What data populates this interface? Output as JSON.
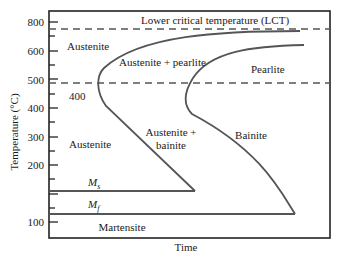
{
  "diagram": {
    "type": "TTT diagram (time-temperature-transformation)",
    "x_axis_label": "Time",
    "y_axis_label": "Temperature (°C)",
    "y_ticks": [
      "800",
      "600",
      "500",
      "400",
      "300",
      "200",
      "100"
    ],
    "lines": {
      "lct_label": "Lower critical temperature (LCT)",
      "ms_label": "M",
      "ms_sub": "s",
      "mf_label": "M",
      "mf_sub": "f"
    },
    "regions": {
      "austenite_top": "Austenite",
      "austenite_pearlite": "Austenite + pearlite",
      "pearlite": "Pearlite",
      "label_400": "400",
      "austenite_mid": "Austenite",
      "austenite_bainite_1": "Austenite +",
      "austenite_bainite_2": "bainite",
      "bainite": "Bainite",
      "martensite": "Martensite"
    },
    "colors": {
      "curve": "#555555",
      "frame": "#222222",
      "dash": "#555555"
    }
  }
}
